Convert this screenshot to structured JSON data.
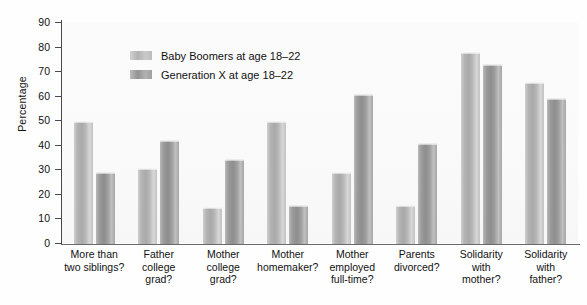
{
  "chart_data": {
    "type": "bar",
    "title": "",
    "xlabel": "",
    "ylabel": "Percentage",
    "ylim": [
      0,
      90
    ],
    "ytick_step": 10,
    "yticks": [
      90,
      80,
      70,
      60,
      50,
      40,
      30,
      20,
      10,
      0
    ],
    "grid": false,
    "legend_position": "top-center-left",
    "categories": [
      "More than\ntwo siblings?",
      "Father\ncollege\ngrad?",
      "Mother\ncollege\ngrad?",
      "Mother\nhomemaker?",
      "Mother\nemployed\nfull-time?",
      "Parents\ndivorced?",
      "Solidarity\nwith\nmother?",
      "Solidarity\nwith\nfather?"
    ],
    "series": [
      {
        "name": "Baby Boomers at age 18–22",
        "color": "#b4b4b4",
        "values": [
          50,
          31,
          15,
          50,
          29.5,
          16,
          78,
          66
        ]
      },
      {
        "name": "Generation X at age 18–22",
        "color": "#8e8e8e",
        "values": [
          29.5,
          42.5,
          34.5,
          16,
          61,
          41,
          73.5,
          59.5
        ]
      }
    ]
  },
  "legend": {
    "items": [
      {
        "label": "Baby Boomers at age 18–22"
      },
      {
        "label": "Generation X at age 18–22"
      }
    ]
  },
  "axis": {
    "y_title": "Percentage",
    "y_tick_labels": [
      "90",
      "80",
      "70",
      "60",
      "50",
      "40",
      "30",
      "20",
      "10",
      "0"
    ]
  },
  "categories_display": [
    [
      "More than",
      "two siblings?"
    ],
    [
      "Father",
      "college",
      "grad?"
    ],
    [
      "Mother",
      "college",
      "grad?"
    ],
    [
      "Mother",
      "homemaker?"
    ],
    [
      "Mother",
      "employed",
      "full-time?"
    ],
    [
      "Parents",
      "divorced?"
    ],
    [
      "Solidarity",
      "with",
      "mother?"
    ],
    [
      "Solidarity",
      "with",
      "father?"
    ]
  ]
}
